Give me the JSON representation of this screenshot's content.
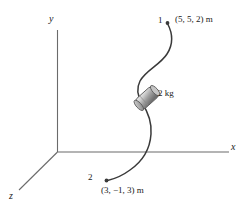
{
  "figure": {
    "kind": "3d-axes-particle-path-diagram",
    "axes": {
      "x_label": "x",
      "y_label": "y",
      "z_label": "z"
    },
    "points": {
      "start": {
        "marker_label": "1",
        "coordinates": "(5, 5, 2) m"
      },
      "end": {
        "marker_label": "2",
        "coordinates": "(3, −1, 3) m"
      }
    },
    "body": {
      "mass_label": "2 kg"
    },
    "colors": {
      "stroke": "#3a3a3a",
      "axis": "#6b6b6b",
      "background": "#ffffff",
      "block_light": "#e8e8e8",
      "block_mid": "#b5b5b5",
      "block_dark": "#7d7d7d"
    }
  }
}
